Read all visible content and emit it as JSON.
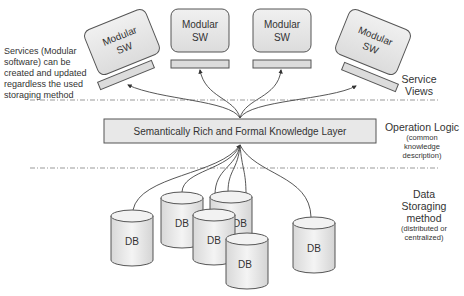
{
  "diagram": {
    "modules": [
      {
        "line1": "Modular",
        "line2": "SW"
      },
      {
        "line1": "Modular",
        "line2": "SW"
      },
      {
        "line1": "Modular",
        "line2": "SW"
      },
      {
        "line1": "Modular",
        "line2": "SW"
      }
    ],
    "knowledge_layer": "Semantically Rich and Formal Knowledge Layer",
    "databases": [
      "DB",
      "DB",
      "DB",
      "DB",
      "DB",
      "DB",
      "DB"
    ],
    "left_note": "Services (Modular software) can be created and updated regardless the used storaging method",
    "right_labels": {
      "service_views": {
        "line1": "Service",
        "line2": "Views"
      },
      "operation_logic": {
        "title": "Operation Logic",
        "sub1": "(common",
        "sub2": "knowledge",
        "sub3": "description)"
      },
      "data_storaging": {
        "line1": "Data",
        "line2": "Storaging",
        "line3": "method",
        "sub1": "(distributed or",
        "sub2": "centralized)"
      }
    }
  },
  "colors": {
    "box_fill": "#e6e6e6",
    "stroke": "#555555",
    "text": "#333333",
    "dash": "#999999"
  }
}
